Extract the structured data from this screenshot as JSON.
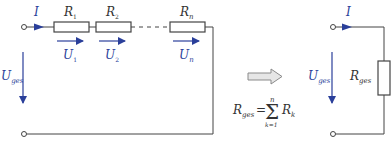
{
  "colors": {
    "wire": "#444444",
    "arrow_blue": "#2a3f9a",
    "equivalence_arrow_fill": "#e6e6e6",
    "equivalence_arrow_stroke": "#8a8a8a",
    "background": "#ffffff"
  },
  "series_circuit": {
    "current_label": "I",
    "voltage_total": {
      "symbol": "U",
      "subscript": "ges"
    },
    "resistors": [
      {
        "symbol": "R",
        "subscript": "1",
        "voltage_symbol": "U",
        "voltage_subscript": "1"
      },
      {
        "symbol": "R",
        "subscript": "2",
        "voltage_symbol": "U",
        "voltage_subscript": "2"
      },
      {
        "symbol": "R",
        "subscript": "n",
        "voltage_symbol": "U",
        "voltage_subscript": "n"
      }
    ]
  },
  "equivalence": {
    "arrow_icon": "right-block-arrow",
    "formula": {
      "lhs_symbol": "R",
      "lhs_subscript": "ges",
      "equals": "=",
      "sum_symbol": "Σ",
      "upper_limit": "n",
      "lower_limit": "k=1",
      "rhs_symbol": "R",
      "rhs_subscript": "k"
    }
  },
  "equivalent_circuit": {
    "current_label": "I",
    "voltage_total": {
      "symbol": "U",
      "subscript": "ges"
    },
    "resistor": {
      "symbol": "R",
      "subscript": "ges"
    }
  }
}
